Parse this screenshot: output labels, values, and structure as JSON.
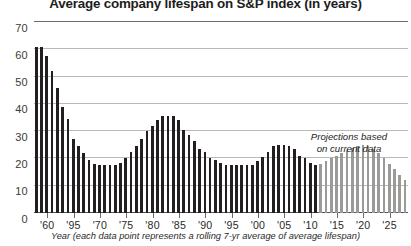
{
  "chart_data": {
    "type": "bar",
    "title": "Average company lifespan on S&P index (in years)",
    "xlabel": "Year (each data point represents a rolling 7-yr average of average lifespan)",
    "ylabel": "",
    "ylim": [
      0,
      70
    ],
    "ytick_values": [
      0,
      10,
      20,
      30,
      40,
      50,
      60,
      70
    ],
    "ytick_labels": [
      "0",
      "10",
      "20",
      "30",
      "40",
      "50",
      "60",
      "70"
    ],
    "grid": true,
    "legend": false,
    "xtick_labels": [
      "'60",
      "'95",
      "'70",
      "'75",
      "'80",
      "'85",
      "'90",
      "'95",
      "'00",
      "'05",
      "'10",
      "'15",
      "'20",
      "'25"
    ],
    "xtick_years": [
      1960,
      1965,
      1970,
      1975,
      1980,
      1985,
      1990,
      1995,
      2000,
      2005,
      2010,
      2015,
      2020,
      2025
    ],
    "x_start_year": 1958,
    "x_end_year": 2028,
    "projection_start_year": 2012,
    "annotation": {
      "line1": "Projections based",
      "line2": "on current data"
    },
    "colors": {
      "actual_bar": "#231f20",
      "projected_bar": "#9a9a98",
      "gridline": "#b9b9b7",
      "axis": "#55524f",
      "text": "#1d1d1b",
      "background": "#ffffff"
    },
    "series": [
      {
        "name": "Average company lifespan (7-yr rolling average)",
        "x": [
          1958,
          1959,
          1960,
          1961,
          1962,
          1963,
          1964,
          1965,
          1966,
          1967,
          1968,
          1969,
          1970,
          1971,
          1972,
          1973,
          1974,
          1975,
          1976,
          1977,
          1978,
          1979,
          1980,
          1981,
          1982,
          1983,
          1984,
          1985,
          1986,
          1987,
          1988,
          1989,
          1990,
          1991,
          1992,
          1993,
          1994,
          1995,
          1996,
          1997,
          1998,
          1999,
          2000,
          2001,
          2002,
          2003,
          2004,
          2005,
          2006,
          2007,
          2008,
          2009,
          2010,
          2011,
          2012,
          2013,
          2014,
          2015,
          2016,
          2017,
          2018,
          2019,
          2020,
          2021,
          2022,
          2023,
          2024,
          2025,
          2026,
          2027,
          2028
        ],
        "values": [
          61,
          61,
          57.5,
          52,
          46,
          39,
          34.5,
          27,
          24.5,
          22,
          19.5,
          18,
          17.5,
          17.5,
          17.5,
          17.5,
          18.5,
          20,
          22.5,
          24.5,
          27,
          30,
          32,
          34,
          35.5,
          35.5,
          35.5,
          34,
          30.5,
          28.5,
          26.5,
          23.5,
          22.5,
          20,
          19.5,
          18.5,
          17.5,
          17.5,
          17.5,
          17.5,
          17.5,
          17.5,
          19,
          20.5,
          22.5,
          24.5,
          25,
          25,
          24.5,
          23.5,
          21,
          20,
          18.5,
          17.5,
          18,
          19,
          20,
          21,
          22,
          23,
          24,
          24.5,
          25,
          24.5,
          23.5,
          22,
          20,
          18,
          16,
          14,
          12
        ],
        "projected_from_index": 54
      }
    ]
  }
}
